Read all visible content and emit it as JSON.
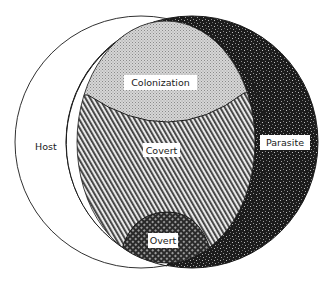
{
  "diagram": {
    "type": "venn",
    "labels": {
      "host": "Host",
      "parasite": "Parasite",
      "colonization": "Colonization",
      "covert": "Covert",
      "overt": "Overt"
    },
    "colors": {
      "background": "#ffffff",
      "outline": "#1a1a1a",
      "parasite_fill": "#1c1c1c",
      "colonization_fill": "#cfcfcf",
      "covert_fill": "#8a8a8a",
      "overt_fill": "#3a3a3a"
    }
  }
}
